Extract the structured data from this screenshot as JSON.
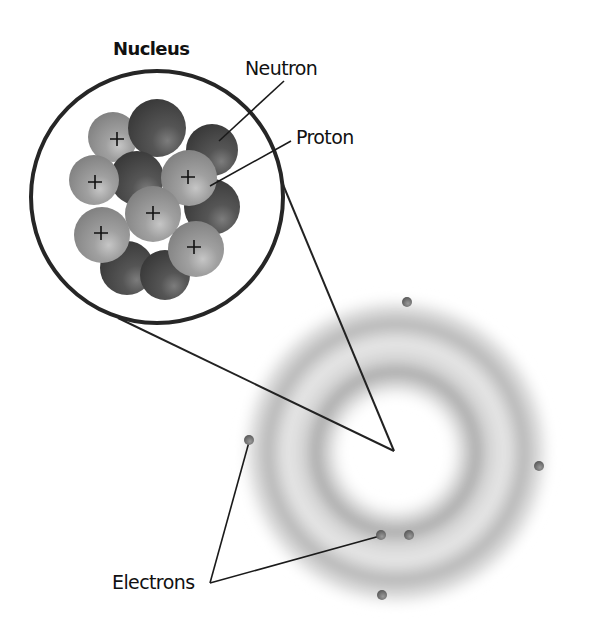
{
  "diagram": {
    "labels": {
      "nucleus": "Nucleus",
      "neutron": "Neutron",
      "proton": "Proton",
      "electrons": "Electrons"
    },
    "colors": {
      "background": "#ffffff",
      "outline": "#222222",
      "proton": "#8f8f8f",
      "proton_highlight": "#c4c4c4",
      "neutron": "#4a4a4a",
      "neutron_highlight": "#7a7a7a",
      "electron": "#6a6a6a",
      "cloud": "#9a9a9a"
    },
    "nucleus_inset": {
      "center": [
        157,
        197
      ],
      "radius": 127,
      "particles": [
        {
          "type": "neutron",
          "cx": 127,
          "cy": 268,
          "r": 27
        },
        {
          "type": "neutron",
          "cx": 165,
          "cy": 275,
          "r": 25
        },
        {
          "type": "proton",
          "cx": 113,
          "cy": 137,
          "r": 25
        },
        {
          "type": "neutron",
          "cx": 157,
          "cy": 128,
          "r": 29
        },
        {
          "type": "neutron",
          "cx": 212,
          "cy": 150,
          "r": 26
        },
        {
          "type": "neutron",
          "cx": 137,
          "cy": 178,
          "r": 27
        },
        {
          "type": "neutron",
          "cx": 212,
          "cy": 207,
          "r": 28
        },
        {
          "type": "proton",
          "cx": 94,
          "cy": 180,
          "r": 25
        },
        {
          "type": "proton",
          "cx": 189,
          "cy": 178,
          "r": 28
        },
        {
          "type": "proton",
          "cx": 153,
          "cy": 214,
          "r": 28
        },
        {
          "type": "proton",
          "cx": 102,
          "cy": 235,
          "r": 28
        },
        {
          "type": "proton",
          "cx": 196,
          "cy": 249,
          "r": 28
        }
      ],
      "proton_count": 6,
      "neutron_count": 6
    },
    "atom": {
      "center": [
        396,
        452
      ],
      "inner_shell_radius": 80,
      "outer_shell_radius": 132,
      "electrons": [
        {
          "cx": 407,
          "cy": 302
        },
        {
          "cx": 249,
          "cy": 440
        },
        {
          "cx": 539,
          "cy": 466
        },
        {
          "cx": 381,
          "cy": 535
        },
        {
          "cx": 409,
          "cy": 535
        },
        {
          "cx": 382,
          "cy": 595
        }
      ],
      "electron_count": 6
    }
  }
}
